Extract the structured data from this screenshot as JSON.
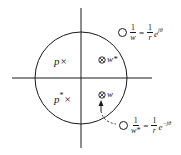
{
  "diagram": {
    "type": "complex-plane pole-zero plot",
    "axes": {
      "horizontal": "real axis",
      "vertical": "imaginary axis"
    },
    "unit_circle": true,
    "poles": [
      {
        "label": "p",
        "marker": "×",
        "quadrant": "upper-left"
      },
      {
        "label": "p",
        "superscript": "*",
        "marker": "×",
        "quadrant": "lower-left"
      }
    ],
    "zeros_inside": [
      {
        "label": "w",
        "superscript": "*",
        "marker": "⊗",
        "quadrant": "upper-right"
      },
      {
        "label": "w",
        "superscript": "",
        "marker": "⊗",
        "quadrant": "lower-right"
      }
    ],
    "zeros_outside": [
      {
        "marker": "○",
        "lhs_num": "1",
        "lhs_den": "w",
        "rhs_num": "1",
        "rhs_den": "r",
        "exp_base": "e",
        "exp_power": "jθ",
        "position": "upper-right outside circle"
      },
      {
        "marker": "○",
        "lhs_num": "1",
        "lhs_den": "w*",
        "rhs_num": "1",
        "rhs_den": "r",
        "exp_base": "e",
        "exp_power": "−jθ",
        "position": "lower-right outside circle"
      }
    ],
    "annotations": {
      "arrow": "arrow pointing to zero w from below",
      "dashed_link": "dashed curve connecting zero w to its reciprocal 1/w*"
    }
  },
  "labels": {
    "p": "p",
    "p_conj": "p",
    "star": "*",
    "pole_marker": "×",
    "zero_marker": "⊗",
    "w": "w",
    "w_conj": "w*"
  },
  "formula_top": {
    "num1": "1",
    "den1": "w",
    "eq": "=",
    "num2": "1",
    "den2": "r",
    "base": "e",
    "power": "jθ"
  },
  "formula_bottom": {
    "num1": "1",
    "den1": "w*",
    "eq": "=",
    "num2": "1",
    "den2": "r",
    "base": "e",
    "power": "−jθ"
  }
}
